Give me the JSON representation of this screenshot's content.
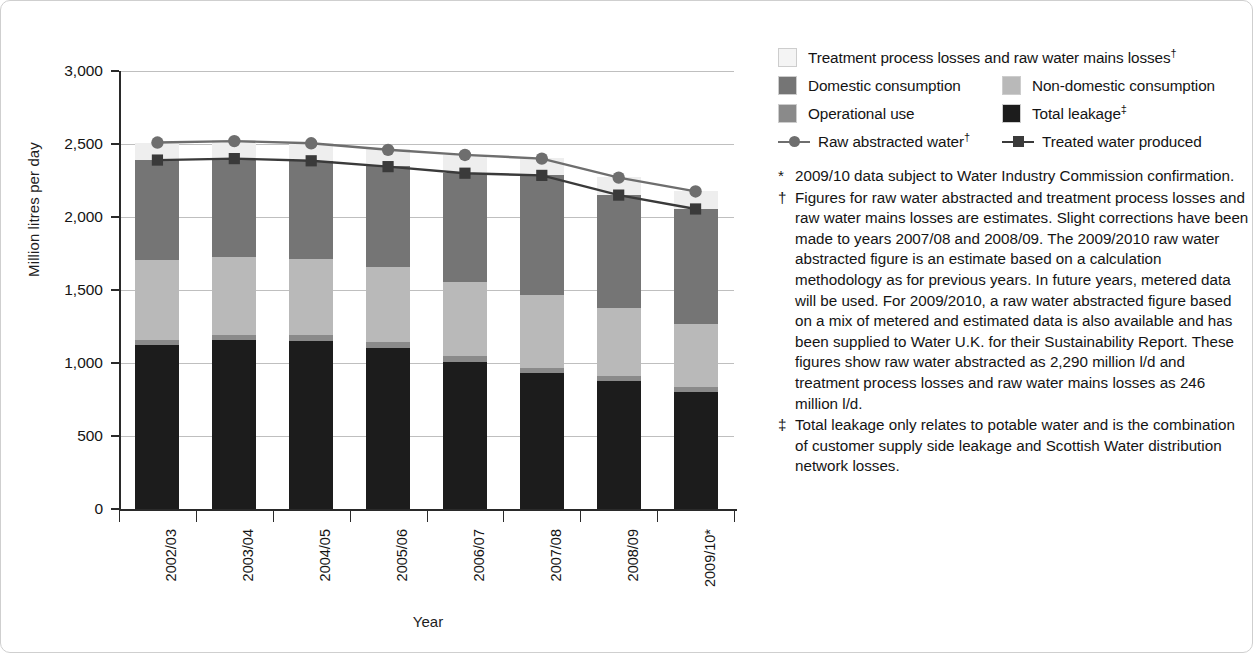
{
  "chart_data": {
    "type": "bar",
    "title": "",
    "xlabel": "Year",
    "ylabel": "Million litres per day",
    "ylim": [
      0,
      3000
    ],
    "yticks": [
      "0",
      "500",
      "1,000",
      "1,500",
      "2,000",
      "2,500",
      "3,000"
    ],
    "ytick_values": [
      0,
      500,
      1000,
      1500,
      2000,
      2500,
      3000
    ],
    "grid": true,
    "legend_position": "right",
    "stacked": true,
    "categories": [
      "2002/03",
      "2003/04",
      "2004/05",
      "2005/06",
      "2006/07",
      "2007/08",
      "2008/09",
      "2009/10*"
    ],
    "series": [
      {
        "name": "Total leakage",
        "key": "total_leakage",
        "color": "#1c1c1c",
        "values": [
          1120,
          1155,
          1150,
          1105,
          1010,
          930,
          875,
          800
        ]
      },
      {
        "name": "Operational use",
        "key": "operational_use",
        "color": "#8a8a8a",
        "values": [
          40,
          40,
          40,
          40,
          35,
          35,
          35,
          35
        ]
      },
      {
        "name": "Non-domestic consumption",
        "key": "non_domestic_consumption",
        "color": "#b9b9b9",
        "values": [
          545,
          530,
          520,
          515,
          510,
          500,
          465,
          435
        ]
      },
      {
        "name": "Domestic consumption",
        "key": "domestic_consumption",
        "color": "#757575",
        "values": [
          685,
          675,
          675,
          690,
          745,
          820,
          775,
          785
        ]
      },
      {
        "name": "Treatment process losses and raw water mains losses",
        "key": "treatment_losses",
        "color": "#eaeaea",
        "values": [
          120,
          125,
          125,
          115,
          125,
          120,
          125,
          120
        ]
      }
    ],
    "lines": [
      {
        "name": "Raw abstracted water",
        "key": "raw_abstracted_water",
        "marker": "circle",
        "color": "#6e6e6e",
        "values": [
          2510,
          2520,
          2505,
          2460,
          2425,
          2400,
          2270,
          2175
        ]
      },
      {
        "name": "Treated water produced",
        "key": "treated_water_produced",
        "marker": "square",
        "color": "#3a3a3a",
        "values": [
          2390,
          2400,
          2385,
          2345,
          2300,
          2285,
          2150,
          2055
        ]
      }
    ]
  },
  "legend": {
    "rows": [
      [
        {
          "label": "Treatment process losses and raw water mains losses",
          "sup": "†",
          "swatch": "#f4f4f4",
          "kind": "swatch",
          "icon": "legend-swatch-treatment-losses"
        }
      ],
      [
        {
          "label": "Domestic consumption",
          "sup": "",
          "swatch": "#757575",
          "kind": "swatch",
          "icon": "legend-swatch-domestic-consumption"
        },
        {
          "label": "Non-domestic consumption",
          "sup": "",
          "swatch": "#b9b9b9",
          "kind": "swatch",
          "icon": "legend-swatch-non-domestic-consumption"
        }
      ],
      [
        {
          "label": "Operational use",
          "sup": "",
          "swatch": "#8a8a8a",
          "kind": "swatch",
          "icon": "legend-swatch-operational-use"
        },
        {
          "label": "Total leakage",
          "sup": "‡",
          "swatch": "#1c1c1c",
          "kind": "swatch",
          "icon": "legend-swatch-total-leakage"
        }
      ],
      [
        {
          "label": "Raw abstracted water",
          "sup": "†",
          "swatch": "#6e6e6e",
          "kind": "line-circle",
          "icon": "legend-line-raw-abstracted-water"
        },
        {
          "label": "Treated water produced",
          "sup": "",
          "swatch": "#3a3a3a",
          "kind": "line-square",
          "icon": "legend-line-treated-water-produced"
        }
      ]
    ]
  },
  "notes": [
    {
      "mark": "*",
      "text": "2009/10 data subject to Water Industry Commission confirmation."
    },
    {
      "mark": "†",
      "text": "Figures for raw water abstracted and treatment process losses and raw water mains losses are estimates. Slight corrections have been made to years 2007/08 and 2008/09. The 2009/2010 raw water abstracted figure is an estimate based on a calculation methodology as for previous years. In future years, metered data will be used. For 2009/2010, a raw water abstracted figure based on a mix of metered and estimated data is also available and has been supplied to Water U.K. for their Sustainability Report. These figures show raw water abstracted as 2,290 million l/d and treatment process losses and raw water mains losses as 246 million l/d."
    },
    {
      "mark": "‡",
      "text": "Total leakage only relates to potable water and is the combination of customer supply side leakage and Scottish Water distribution network losses."
    }
  ]
}
